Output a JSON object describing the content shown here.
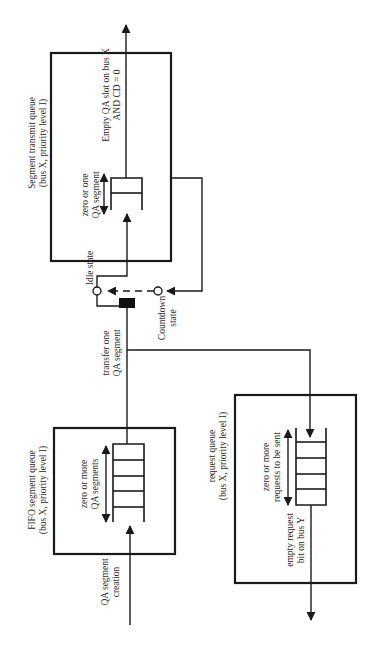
{
  "diagram": {
    "orientation": "rotated-90-ccw",
    "line_color": "#1a1a1a",
    "background": "#ffffff",
    "segment_transmit_queue": {
      "title_line1": "Segment transmit queue",
      "title_line2": "(bus X, priority level I)",
      "queue_label_line1": "zero or one",
      "queue_label_line2": "QA segment",
      "condition_line1": "Empty QA slot on bus X",
      "condition_line2": "AND CD = 0"
    },
    "states": {
      "idle": "Idle state",
      "countdown_line1": "Countdown",
      "countdown_line2": "state"
    },
    "transfer": {
      "line1": "transfer one",
      "line2": "QA segment"
    },
    "fifo_segment_queue": {
      "title_line1": "FIFO segment queue",
      "title_line2": "(bus X, priority level I)",
      "queue_label_line1": "zero or more",
      "queue_label_line2": "QA segments",
      "input_line1": "QA segment",
      "input_line2": "creation"
    },
    "request_queue": {
      "title_line1": "request queue",
      "title_line2": "(bus X, priority level I)",
      "queue_label_line1": "zero or more",
      "queue_label_line2": "requests to be sent",
      "output_line1": "empty request",
      "output_line2": "bit on bus Y"
    }
  }
}
